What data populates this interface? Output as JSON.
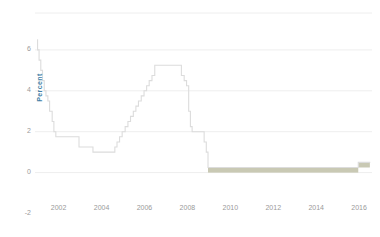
{
  "chart_data": {
    "type": "line",
    "title": "",
    "subtitle": "",
    "xlabel": "",
    "ylabel": "Percent",
    "xlim": [
      2000.9,
      2016.6
    ],
    "ylim": [
      -2.6,
      7.3
    ],
    "grid": true,
    "gridlines_y": [
      6,
      4,
      2,
      0
    ],
    "legend": "none",
    "xticks": [
      "2002",
      "2004",
      "2006",
      "2008",
      "2010",
      "2012",
      "2014",
      "2016"
    ],
    "xtick_values": [
      2002,
      2004,
      2006,
      2008,
      2010,
      2012,
      2014,
      2016
    ],
    "yticks": [
      "6",
      "4",
      "2",
      "0",
      "-2"
    ],
    "ytick_values": [
      6,
      4,
      2,
      0,
      -2
    ],
    "line_color": "#d8d8d8",
    "band_color": "#c9c9b4",
    "axis_label_color": "#3f7fa6",
    "tick_color": "#9a9a9a",
    "gridline_color": "#eeeeee",
    "series": [
      {
        "name": "Federal funds target rate",
        "step": "post",
        "x": [
          2001.0,
          2001.02,
          2001.09,
          2001.17,
          2001.25,
          2001.33,
          2001.41,
          2001.5,
          2001.58,
          2001.7,
          2001.78,
          2001.87,
          2001.95,
          2002.0,
          2002.95,
          2003.5,
          2003.6,
          2004.0,
          2004.5,
          2004.62,
          2004.72,
          2004.84,
          2004.96,
          2005.1,
          2005.23,
          2005.35,
          2005.48,
          2005.6,
          2005.72,
          2005.85,
          2005.98,
          2006.1,
          2006.22,
          2006.35,
          2006.48,
          2007.6,
          2007.72,
          2007.85,
          2007.96,
          2008.06,
          2008.14,
          2008.22,
          2008.32,
          2008.78,
          2008.88,
          2008.96,
          2015.96,
          2016.5
        ],
        "y": [
          6.5,
          6.0,
          5.5,
          5.0,
          4.5,
          4.0,
          3.75,
          3.5,
          3.0,
          2.5,
          2.0,
          1.75,
          1.75,
          1.75,
          1.25,
          1.25,
          1.0,
          1.0,
          1.0,
          1.25,
          1.5,
          1.75,
          2.0,
          2.25,
          2.5,
          2.75,
          3.0,
          3.25,
          3.5,
          3.75,
          4.0,
          4.25,
          4.5,
          4.75,
          5.25,
          5.25,
          4.75,
          4.5,
          4.25,
          3.0,
          2.25,
          2.0,
          2.0,
          1.5,
          1.0,
          0.25,
          0.5,
          0.5
        ]
      }
    ],
    "band": {
      "name": "Target range (lower to upper bound)",
      "description": "Zero lower bound target range band",
      "x_start": 2008.96,
      "x_end": 2016.5,
      "segments": [
        {
          "x_start": 2008.96,
          "x_end": 2015.96,
          "lower": 0.0,
          "upper": 0.25
        },
        {
          "x_start": 2015.96,
          "x_end": 2016.5,
          "lower": 0.25,
          "upper": 0.5
        }
      ]
    }
  }
}
